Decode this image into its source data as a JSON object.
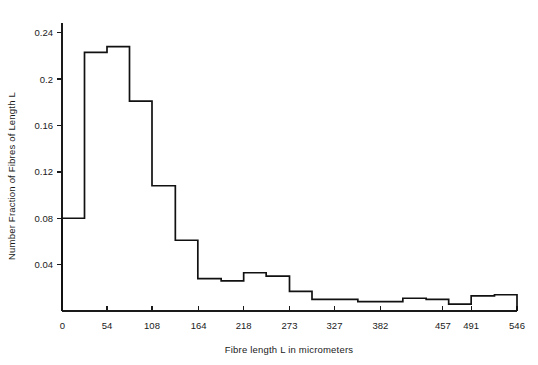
{
  "chart_data": {
    "type": "bar",
    "title": "",
    "xlabel": "Fibre length L in micrometers",
    "ylabel": "Number Fraction of Fibres of Length L",
    "xlim": [
      0,
      546
    ],
    "ylim": [
      0,
      0.26
    ],
    "grid": false,
    "legend": null,
    "xticks": [
      0,
      54,
      108,
      164,
      218,
      273,
      327,
      382,
      457,
      491,
      546
    ],
    "xtick_labels": [
      "0",
      "54",
      "108",
      "164",
      "218",
      "273",
      "327",
      "382",
      "457",
      "491",
      "546"
    ],
    "yticks": [
      0,
      0.04,
      0.08,
      0.12,
      0.16,
      0.2,
      0.24
    ],
    "ytick_labels": [
      "0",
      "0.04",
      "0.08",
      "0.12",
      "0.16",
      "0.2",
      "0.24"
    ],
    "bin_edges": [
      0,
      27,
      54,
      81,
      108,
      136,
      163,
      191,
      218,
      245,
      273,
      300,
      327,
      355,
      382,
      409,
      437,
      464,
      491,
      519,
      546
    ],
    "values": [
      0.08,
      0.223,
      0.228,
      0.181,
      0.108,
      0.061,
      0.028,
      0.026,
      0.033,
      0.03,
      0.017,
      0.01,
      0.01,
      0.008,
      0.008,
      0.011,
      0.01,
      0.006,
      0.013,
      0.014
    ],
    "series": [
      {
        "name": "Fibre length distribution",
        "values": [
          0.08,
          0.223,
          0.228,
          0.181,
          0.108,
          0.061,
          0.028,
          0.026,
          0.033,
          0.03,
          0.017,
          0.01,
          0.01,
          0.008,
          0.008,
          0.011,
          0.01,
          0.006,
          0.013,
          0.014
        ]
      }
    ],
    "line_color": "#111111",
    "bar_style": "step-outline"
  },
  "axes": {
    "x_title": "Fibre length L in micrometers",
    "y_title": "Number Fraction of Fibres of Length L"
  }
}
